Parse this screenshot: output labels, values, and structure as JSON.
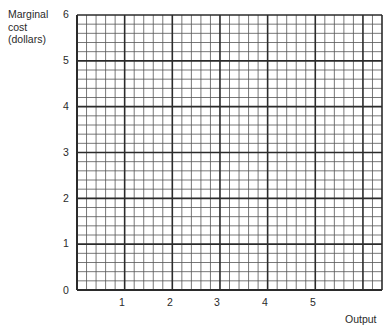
{
  "chart_data": {
    "type": "line",
    "title": "",
    "xlabel": "Output",
    "ylabel": "Marginal cost (dollars)",
    "ylabel_lines": [
      "Marginal",
      "cost",
      "(dollars)"
    ],
    "x_ticks": [
      "1",
      "2",
      "3",
      "4",
      "5"
    ],
    "y_ticks": [
      "0",
      "1",
      "2",
      "3",
      "4",
      "5",
      "6"
    ],
    "xlim": [
      0,
      6.4
    ],
    "ylim": [
      0,
      6
    ],
    "grid": true,
    "grid_minor_divisions_per_unit": 5,
    "series": [],
    "note": "Blank graph-paper grid; no data plotted"
  },
  "colors": {
    "major_line": "#2b2b2b",
    "minor_line": "#555555",
    "background": "#ffffff"
  }
}
